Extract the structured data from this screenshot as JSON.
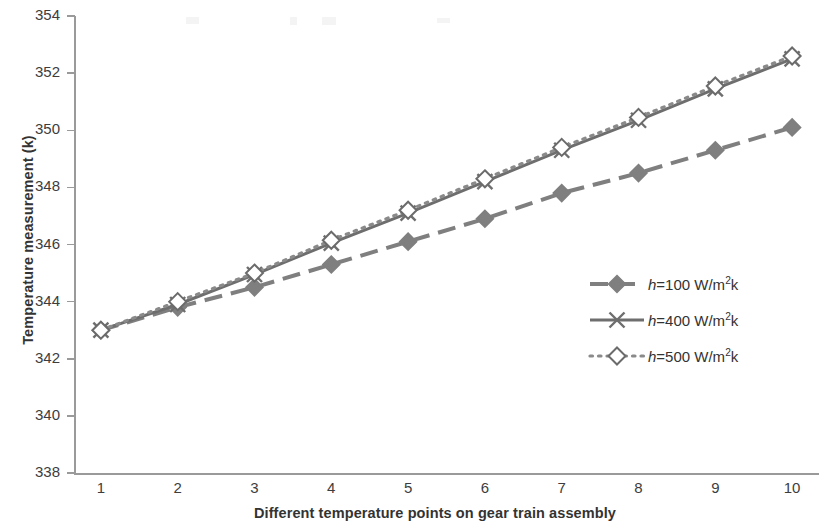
{
  "chart_data": {
    "type": "line",
    "title": "",
    "xlabel": "Different temperature points on gear train assembly",
    "ylabel": "Temperature measurement (k)",
    "x": [
      1,
      2,
      3,
      4,
      5,
      6,
      7,
      8,
      9,
      10
    ],
    "xticklabels": [
      "1",
      "2",
      "3",
      "4",
      "5",
      "6",
      "7",
      "8",
      "9",
      "10"
    ],
    "yticklabels": [
      "338",
      "340",
      "342",
      "344",
      "346",
      "348",
      "350",
      "352",
      "354"
    ],
    "xlim": [
      0.65,
      10.35
    ],
    "ylim": [
      338,
      354
    ],
    "ytick_step": 2,
    "grid": false,
    "legend_position": "center-right",
    "series": [
      {
        "name": "h=100 W/m²k",
        "label_prefix": "h",
        "label_rest": "=100 W/m",
        "label_sup": "2",
        "label_suffix": "k",
        "linestyle": "dashed",
        "marker": "diamond-filled",
        "color": "#7f7f7f",
        "values": [
          343.0,
          343.8,
          344.5,
          345.3,
          346.1,
          346.9,
          347.8,
          348.5,
          349.3,
          350.1
        ]
      },
      {
        "name": "h=400 W/m²k",
        "label_prefix": "h",
        "label_rest": "=400 W/m",
        "label_sup": "2",
        "label_suffix": "k",
        "linestyle": "solid",
        "marker": "cross-x",
        "color": "#6e6e6e",
        "values": [
          343.0,
          343.9,
          344.95,
          346.05,
          347.1,
          348.2,
          349.3,
          350.35,
          351.45,
          352.5
        ]
      },
      {
        "name": "h=500 W/m²k",
        "label_prefix": "h",
        "label_rest": "=500 W/m",
        "label_sup": "2",
        "label_suffix": "k",
        "linestyle": "dotted",
        "marker": "diamond-open",
        "color": "#8a8a8a",
        "values": [
          343.0,
          344.0,
          345.0,
          346.15,
          347.2,
          348.3,
          349.4,
          350.45,
          351.55,
          352.6
        ]
      }
    ]
  },
  "axis": {
    "y_title": "Temperature measurement (k)",
    "x_title": "Different temperature points on gear train assembly"
  }
}
